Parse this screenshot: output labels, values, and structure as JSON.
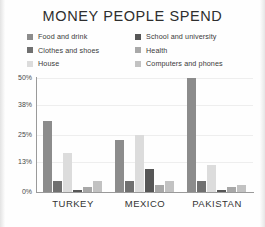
{
  "title": "MONEY PEOPLE SPEND",
  "legend": {
    "items": [
      {
        "label": "Food and drink",
        "color": "#8c8c8c"
      },
      {
        "label": "School and university",
        "color": "#565656"
      },
      {
        "label": "Clothes and shoes",
        "color": "#707070"
      },
      {
        "label": "Health",
        "color": "#a8a8a8"
      },
      {
        "label": "House",
        "color": "#dcdcdc"
      },
      {
        "label": "Computers and phones",
        "color": "#c2c2c2"
      }
    ]
  },
  "chart_data": {
    "type": "bar",
    "title": "MONEY PEOPLE SPEND",
    "xlabel": "",
    "ylabel": "",
    "ylim": [
      0,
      50
    ],
    "yticks": [
      0,
      13,
      25,
      38,
      50
    ],
    "ytick_labels": [
      "0%",
      "13%",
      "25%",
      "38%",
      "50%"
    ],
    "grid": true,
    "legend_position": "top",
    "categories": [
      "TURKEY",
      "MEXICO",
      "PAKISTAN"
    ],
    "series": [
      {
        "name": "Food and drink",
        "color": "#8c8c8c",
        "values": [
          31,
          23,
          50
        ]
      },
      {
        "name": "Clothes and shoes",
        "color": "#707070",
        "values": [
          5,
          5,
          5
        ]
      },
      {
        "name": "House",
        "color": "#dcdcdc",
        "values": [
          17,
          25,
          12
        ]
      },
      {
        "name": "School and university",
        "color": "#565656",
        "values": [
          1,
          10,
          1
        ]
      },
      {
        "name": "Health",
        "color": "#a8a8a8",
        "values": [
          2,
          3,
          2
        ]
      },
      {
        "name": "Computers and phones",
        "color": "#c2c2c2",
        "values": [
          5,
          5,
          3
        ]
      }
    ]
  },
  "axis": {
    "ytick_labels": [
      "50%",
      "38%",
      "25%",
      "13%",
      "0%"
    ]
  }
}
